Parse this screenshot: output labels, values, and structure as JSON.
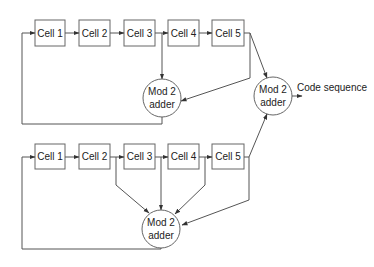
{
  "diagram": {
    "type": "dual-LFSR code generator (Gold code style)",
    "colors": {
      "line": "#555555",
      "box_stroke": "#666666",
      "text": "#222222",
      "background": "#ffffff"
    },
    "top_register": {
      "cells": [
        {
          "label": "Cell 1"
        },
        {
          "label": "Cell 2"
        },
        {
          "label": "Cell 3"
        },
        {
          "label": "Cell 4"
        },
        {
          "label": "Cell 5"
        }
      ],
      "adder": {
        "line1": "Mod 2",
        "line2": "adder"
      },
      "taps": [
        "Cell 3",
        "Cell 5"
      ]
    },
    "bottom_register": {
      "cells": [
        {
          "label": "Cell 1"
        },
        {
          "label": "Cell 2"
        },
        {
          "label": "Cell 3"
        },
        {
          "label": "Cell 4"
        },
        {
          "label": "Cell 5"
        }
      ],
      "adder": {
        "line1": "Mod 2",
        "line2": "adder"
      },
      "taps": [
        "Cell 2",
        "Cell 3",
        "Cell 4",
        "Cell 5"
      ]
    },
    "output_adder": {
      "line1": "Mod 2",
      "line2": "adder"
    },
    "output_label": "Code sequence"
  }
}
